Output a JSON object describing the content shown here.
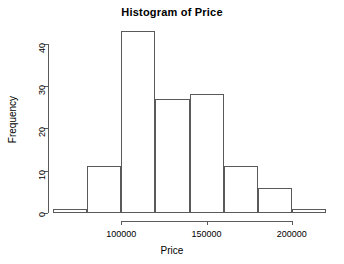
{
  "chart_data": {
    "type": "bar",
    "title": "Histogram of Price",
    "xlabel": "Price",
    "ylabel": "Frequency",
    "bin_width": 20000,
    "bin_edges": [
      60000,
      80000,
      100000,
      120000,
      140000,
      160000,
      180000,
      200000,
      220000
    ],
    "categories": [
      "60000-80000",
      "80000-100000",
      "100000-120000",
      "120000-140000",
      "140000-160000",
      "160000-180000",
      "180000-200000",
      "200000-220000"
    ],
    "values": [
      1,
      11,
      43,
      27,
      28,
      11,
      6,
      1
    ],
    "xlim": [
      60000,
      220000
    ],
    "ylim": [
      0,
      43
    ],
    "x_ticks": [
      100000,
      150000,
      200000
    ],
    "x_tick_labels": [
      "100000",
      "150000",
      "200000"
    ],
    "y_ticks": [
      0,
      10,
      20,
      30,
      40
    ],
    "y_tick_labels": [
      "0",
      "10",
      "20",
      "30",
      "40"
    ],
    "grid": false,
    "legend": false,
    "bar_border_color": "#5a5a5a",
    "bar_fill_color": "#ffffff",
    "axis_color": "#5a5a5a",
    "background_color": "#ffffff"
  }
}
